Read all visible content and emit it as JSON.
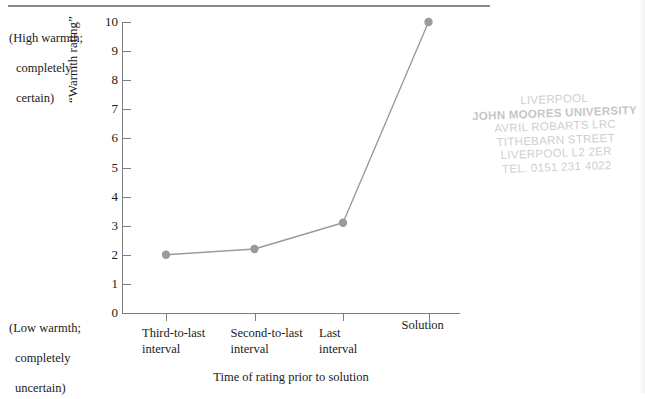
{
  "figure": {
    "top_rule": "horizontal-rule"
  },
  "annotations": {
    "high_anchor": {
      "line1": "(High warmth;",
      "line2": "completely",
      "line3": "certain)"
    },
    "low_anchor": {
      "line1": "(Low warmth;",
      "line2": "completely",
      "line3": "uncertain)"
    }
  },
  "library_stamp": {
    "line1": "LIVERPOOL",
    "line2": "JOHN MOORES UNIVERSITY",
    "line3": "AVRIL ROBARTS LRC",
    "line4": "TITHEBARN STREET",
    "line5": "LIVERPOOL L2 2ER",
    "line6": "TEL. 0151 231 4022"
  },
  "colors": {
    "series_line": "#9a9a9a",
    "marker": "#9a9a9a",
    "axis": "#7d7d7d",
    "text": "#1a1a1a",
    "stamp": "#cfcfcf"
  },
  "chart_data": {
    "type": "line",
    "title": "",
    "subtitle": "",
    "xlabel": "Time of rating prior to solution",
    "ylabel": "“Warmth rating”",
    "categories": [
      "Third-to-last\ninterval",
      "Second-to-last\ninterval",
      "Last\ninterval",
      "Solution"
    ],
    "category_labels_flat": [
      "Third-to-last interval",
      "Second-to-last interval",
      "Last interval",
      "Solution"
    ],
    "values": [
      2.0,
      2.2,
      3.1,
      10.0
    ],
    "ylim": [
      0,
      10
    ],
    "yticks": [
      0,
      1,
      2,
      3,
      4,
      5,
      6,
      7,
      8,
      9,
      10
    ],
    "ytick_labels": [
      "0",
      "1",
      "2",
      "3",
      "4",
      "5",
      "6",
      "7",
      "8",
      "9",
      "10"
    ],
    "grid": false,
    "legend": false,
    "legend_position": "none",
    "marker": "circle",
    "y_axis_low_anchor": "(Low warmth; completely uncertain)",
    "y_axis_high_anchor": "(High warmth; completely certain)"
  }
}
